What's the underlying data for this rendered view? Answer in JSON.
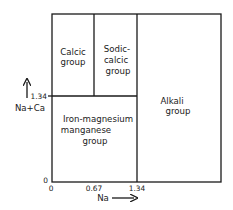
{
  "diagram": {
    "type": "classification-field-diagram",
    "x_axis": {
      "label": "Na",
      "ticks": [
        "0",
        "0.67",
        "1.34"
      ]
    },
    "y_axis": {
      "label": "Na+Ca",
      "ticks": [
        "0",
        "1.34"
      ]
    },
    "regions": [
      {
        "id": "calcic",
        "lines": [
          "Calcic",
          "group"
        ]
      },
      {
        "id": "sodic-calcic",
        "lines": [
          "Sodic-",
          "calcic",
          "group"
        ]
      },
      {
        "id": "iron-magnesium-manganese",
        "lines": [
          "Iron-magnesium",
          "manganese",
          "group"
        ]
      },
      {
        "id": "alkali",
        "lines": [
          "Alkali",
          "group"
        ]
      }
    ],
    "colors": {
      "ink": "#1a1a1a",
      "background": "#ffffff"
    }
  }
}
